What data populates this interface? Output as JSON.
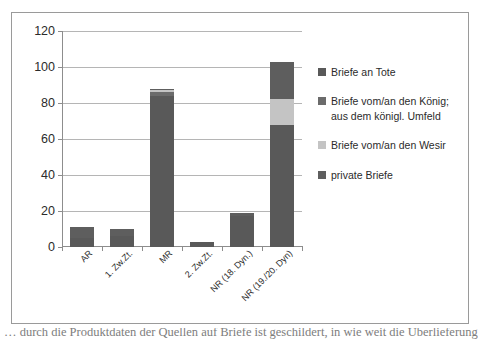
{
  "chart_data": {
    "type": "bar",
    "subtype": "stacked-bar",
    "title": "",
    "xlabel": "",
    "ylabel": "",
    "ylim": [
      0,
      120
    ],
    "ytick_step": 20,
    "yticks": [
      0,
      20,
      40,
      60,
      80,
      100,
      120
    ],
    "grid": true,
    "legend_position": "right",
    "categories": [
      "AR",
      "1. Zw.Zt.",
      "MR",
      "2. Zw.Zt.",
      "NR (18. Dyn.)",
      "NR (19./20. Dyn)"
    ],
    "series": [
      {
        "name": "Briefe an Tote",
        "color": "#595959",
        "values": [
          5,
          6,
          84,
          3,
          17,
          68
        ]
      },
      {
        "name": "Briefe vom/an den König; aus dem königl. Umfeld",
        "color": "#6b6b6b",
        "values": [
          0,
          0,
          2,
          0,
          0,
          0
        ]
      },
      {
        "name": "Briefe vom/an den Wesir",
        "color": "#c4c4c4",
        "values": [
          0,
          0,
          1,
          0,
          0,
          14
        ]
      },
      {
        "name": "private Briefe",
        "color": "#5e5e5e",
        "values": [
          6,
          4,
          1,
          0,
          2,
          21
        ]
      }
    ],
    "totals": [
      11,
      10,
      88,
      3,
      19,
      103
    ]
  },
  "legend": {
    "entries": [
      {
        "label": "Briefe an Tote",
        "color": "#595959"
      },
      {
        "label": "Briefe vom/an den König; aus dem königl. Umfeld",
        "color": "#6b6b6b"
      },
      {
        "label": "Briefe vom/an den Wesir",
        "color": "#c4c4c4"
      },
      {
        "label": "private Briefe",
        "color": "#5e5e5e"
      }
    ]
  },
  "caption": {
    "text": "… durch die Produktdaten der Quellen auf Briefe ist geschildert, in wie weit die Überlieferung …"
  }
}
